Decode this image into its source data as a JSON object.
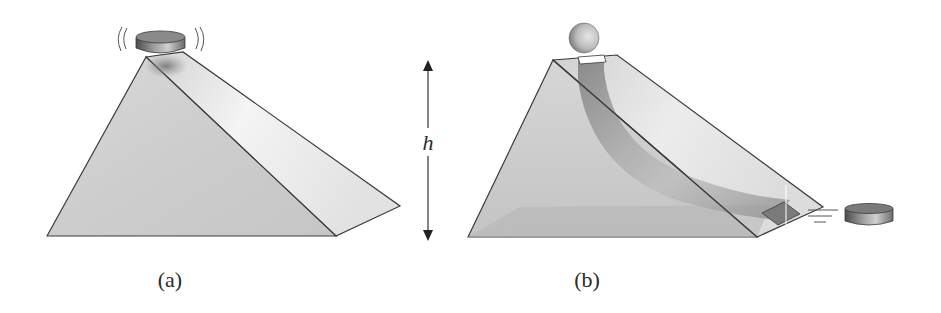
{
  "figure": {
    "panel_a": {
      "caption": "(a)",
      "description": "Wedge (inclined plane) with a vibrating puck sitting on its top edge",
      "objects": [
        "wedge",
        "puck-vibrating"
      ]
    },
    "height_marker": {
      "label": "h",
      "style": "double-headed vertical arrow"
    },
    "panel_b": {
      "caption": "(b)",
      "description": "Transparent wedge with a curved internal tunnel; a ball enters at the top and a puck exits at the lower right",
      "objects": [
        "wedge-transparent",
        "curved-tunnel",
        "ball",
        "puck-exiting"
      ]
    },
    "colors": {
      "outline": "#3a3a3a",
      "wedge_face_light": "#e6e6e6",
      "wedge_face_mid": "#cfcfcf",
      "tunnel_dark": "#8c8c8c",
      "text": "#2a2a2a"
    }
  }
}
